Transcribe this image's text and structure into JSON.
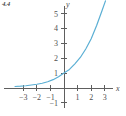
{
  "figure": {
    "label": "4.4",
    "background_color": "#ffffff",
    "axis_color": "#5e5e5e",
    "curve_color": "#5bafd4"
  },
  "chart_data": {
    "type": "line",
    "title": "",
    "xlabel": "x",
    "ylabel": "y",
    "xlim": [
      -3.6,
      3.6
    ],
    "ylim": [
      -1.4,
      5.9
    ],
    "grid": false,
    "legend": null,
    "x_ticks": [
      -3,
      -2,
      -1,
      1,
      2,
      3
    ],
    "x_tick_labels": [
      "−3",
      "−2",
      "−1",
      "1",
      "2",
      "3"
    ],
    "y_ticks": [
      -1,
      1,
      2,
      3,
      4,
      5
    ],
    "y_tick_labels": [
      "−1",
      "1",
      "2",
      "3",
      "4",
      "5"
    ],
    "series": [
      {
        "name": "exponential",
        "x": [
          -3.6,
          -3.2,
          -2.8,
          -2.4,
          -2.0,
          -1.6,
          -1.2,
          -0.8,
          -0.4,
          0.0,
          0.4,
          0.8,
          1.2,
          1.6,
          2.0,
          2.4,
          2.8,
          3.05
        ],
        "y": [
          0.1,
          0.12,
          0.15,
          0.2,
          0.25,
          0.32,
          0.42,
          0.56,
          0.75,
          1.0,
          1.25,
          1.62,
          2.05,
          2.62,
          3.3,
          4.2,
          5.2,
          5.85
        ]
      }
    ]
  },
  "axis_labels": {
    "x_axis_name": "x",
    "y_axis_name": "y"
  }
}
